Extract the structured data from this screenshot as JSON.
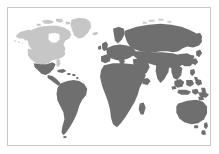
{
  "figure": {
    "type": "world-map",
    "background_color": "#ffffff",
    "border_color": "#c9c9c9",
    "border_width_px": 1,
    "frame_inset_px": 7,
    "width_px": 219,
    "height_px": 154
  },
  "legend": {
    "visible": false,
    "entries": [
      {
        "key": "highlight",
        "label": "North America",
        "color": "#c6c6c6"
      },
      {
        "key": "base",
        "label": "Rest of world",
        "color": "#6f6f6f"
      }
    ]
  },
  "regions": [
    {
      "id": "north-america",
      "label": "North America",
      "color_key": "highlight",
      "color": "#c6c6c6"
    },
    {
      "id": "greenland",
      "label": "Greenland",
      "color_key": "highlight",
      "color": "#c6c6c6"
    },
    {
      "id": "alaska",
      "label": "Alaska",
      "color_key": "highlight",
      "color": "#c6c6c6"
    },
    {
      "id": "canadian-arctic",
      "label": "Canadian Arctic Islands",
      "color_key": "highlight",
      "color": "#c6c6c6"
    },
    {
      "id": "central-america",
      "label": "Central America",
      "color_key": "base",
      "color": "#6f6f6f"
    },
    {
      "id": "caribbean",
      "label": "Caribbean",
      "color_key": "base",
      "color": "#6f6f6f"
    },
    {
      "id": "south-america",
      "label": "South America",
      "color_key": "base",
      "color": "#6f6f6f"
    },
    {
      "id": "europe",
      "label": "Europe",
      "color_key": "base",
      "color": "#6f6f6f"
    },
    {
      "id": "africa",
      "label": "Africa",
      "color_key": "base",
      "color": "#6f6f6f"
    },
    {
      "id": "madagascar",
      "label": "Madagascar",
      "color_key": "base",
      "color": "#6f6f6f"
    },
    {
      "id": "asia",
      "label": "Asia",
      "color_key": "base",
      "color": "#6f6f6f"
    },
    {
      "id": "japan",
      "label": "Japan",
      "color_key": "base",
      "color": "#6f6f6f"
    },
    {
      "id": "southeast-asia-islands",
      "label": "Southeast Asian Islands",
      "color_key": "base",
      "color": "#6f6f6f"
    },
    {
      "id": "australia",
      "label": "Australia",
      "color_key": "base",
      "color": "#6f6f6f"
    },
    {
      "id": "new-zealand",
      "label": "New Zealand",
      "color_key": "base",
      "color": "#6f6f6f"
    },
    {
      "id": "british-isles",
      "label": "British Isles",
      "color_key": "base",
      "color": "#6f6f6f"
    },
    {
      "id": "arctic-islands",
      "label": "Arctic Islands",
      "color_key": "base",
      "color": "#6f6f6f"
    }
  ]
}
